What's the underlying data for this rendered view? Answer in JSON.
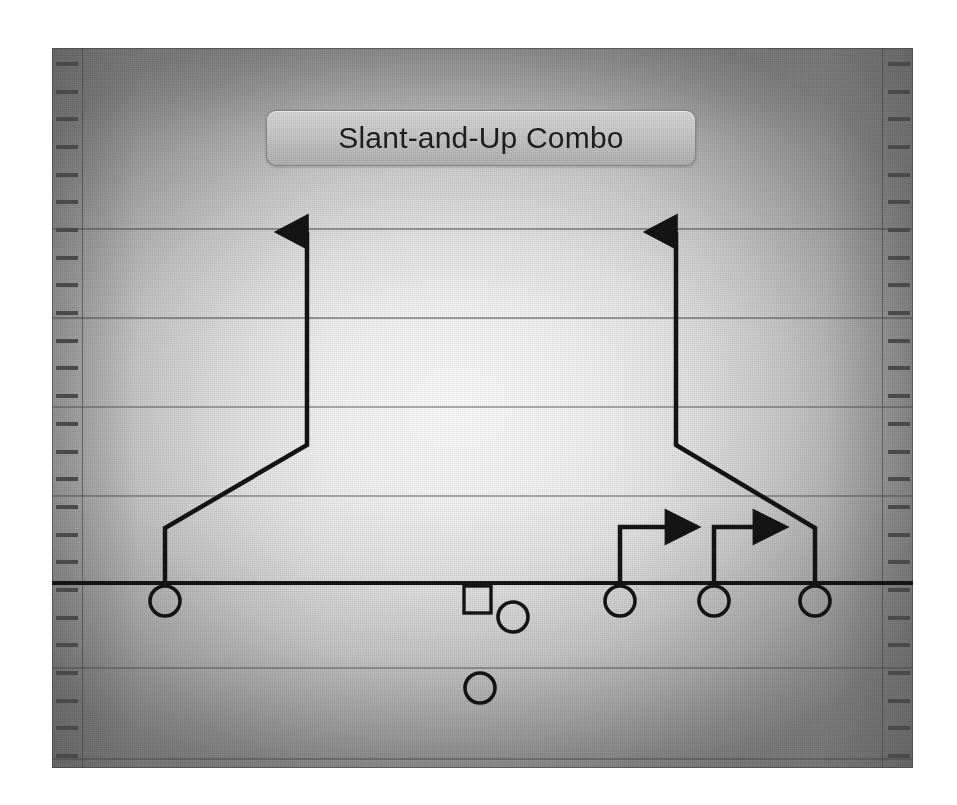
{
  "diagram": {
    "title": "Slant-and-Up Combo",
    "sport": "american-football",
    "kind": "play-diagram",
    "field": {
      "line_of_scrimmage_label": "line-of-scrimmage",
      "yard_line_count": 7,
      "hash_tick_count_per_sideline": 26,
      "colors": {
        "field_center": "#f7f7f7",
        "field_edge": "#8a8a8a",
        "yard_line": "#4a4a4a",
        "route_line": "#141414",
        "player_outline": "#141414",
        "title_plate": "#c9c9c9",
        "title_text": "#1d1d1d"
      }
    },
    "players": [
      {
        "id": "X",
        "name": "split-end-left",
        "shape": "circle",
        "x": 165,
        "y": 601,
        "role": "receiver"
      },
      {
        "id": "C",
        "name": "center",
        "shape": "square",
        "x": 478,
        "y": 601,
        "role": "lineman"
      },
      {
        "id": "QB",
        "name": "quarterback",
        "shape": "circle",
        "x": 513,
        "y": 617,
        "role": "quarterback"
      },
      {
        "id": "RB",
        "name": "running-back",
        "shape": "circle",
        "x": 480,
        "y": 688,
        "role": "back"
      },
      {
        "id": "Y",
        "name": "inside-receiver-right",
        "shape": "circle",
        "x": 620,
        "y": 601,
        "role": "receiver"
      },
      {
        "id": "H",
        "name": "middle-receiver-right",
        "shape": "circle",
        "x": 714,
        "y": 601,
        "role": "receiver"
      },
      {
        "id": "Z",
        "name": "split-end-right",
        "shape": "circle",
        "x": 815,
        "y": 601,
        "role": "receiver"
      }
    ],
    "routes": [
      {
        "id": "route-x",
        "name": "slant-and-up-left",
        "player": "X",
        "arrow": "up",
        "points": "165,586 165,528 307,445 307,232"
      },
      {
        "id": "route-y",
        "name": "out-route-inside-right",
        "player": "Y",
        "arrow": "right",
        "points": "620,586 620,527 698,527"
      },
      {
        "id": "route-h",
        "name": "out-route-middle-right",
        "player": "H",
        "arrow": "right",
        "points": "714,586 714,527 786,527"
      },
      {
        "id": "route-z",
        "name": "slant-and-up-right",
        "player": "Z",
        "arrow": "up",
        "points": "815,586 815,528 676,445 676,232"
      }
    ],
    "scrimmage_line": {
      "y": 583,
      "x_start": 0,
      "x_end": 861
    }
  }
}
